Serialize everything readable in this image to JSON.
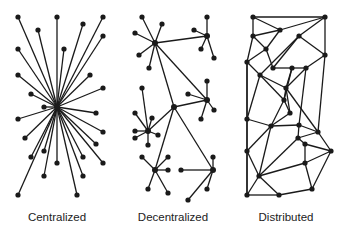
{
  "labels": {
    "centralized": "Centralized",
    "decentralized": "Decentralized",
    "distributed": "Distributed"
  },
  "style": {
    "line_color": "#1a1a1a",
    "node_color": "#1a1a1a",
    "node_radius": 2.6,
    "line_width": 1.3
  },
  "networks": {
    "centralized": {
      "hub": [
        57,
        107
      ],
      "nodes": [
        [
          18,
          17
        ],
        [
          57,
          17
        ],
        [
          103,
          17
        ],
        [
          83,
          24
        ],
        [
          38,
          30
        ],
        [
          103,
          36
        ],
        [
          18,
          49
        ],
        [
          64,
          49
        ],
        [
          18,
          75
        ],
        [
          90,
          75
        ],
        [
          31,
          94
        ],
        [
          103,
          88
        ],
        [
          44,
          107
        ],
        [
          96,
          113
        ],
        [
          18,
          119
        ],
        [
          103,
          132
        ],
        [
          25,
          138
        ],
        [
          96,
          144
        ],
        [
          44,
          151
        ],
        [
          31,
          157
        ],
        [
          83,
          157
        ],
        [
          57,
          163
        ],
        [
          103,
          163
        ],
        [
          44,
          176
        ],
        [
          83,
          176
        ],
        [
          18,
          195
        ],
        [
          77,
          195
        ]
      ]
    },
    "decentralized": {
      "hubs": {
        "A": [
          155,
          43
        ],
        "B": [
          207,
          36
        ],
        "C": [
          174,
          107
        ],
        "D": [
          207,
          100
        ],
        "E": [
          148,
          131
        ],
        "F": [
          155,
          170
        ],
        "G": [
          213,
          170
        ]
      },
      "hub_links": [
        [
          "A",
          "B"
        ],
        [
          "A",
          "C"
        ],
        [
          "A",
          "D"
        ],
        [
          "C",
          "D"
        ],
        [
          "C",
          "E"
        ],
        [
          "C",
          "F"
        ],
        [
          "C",
          "G"
        ]
      ],
      "leaves": {
        "A": [
          [
            142,
            17
          ],
          [
            162,
            24
          ],
          [
            135,
            33
          ],
          [
            139,
            55
          ],
          [
            149,
            68
          ]
        ],
        "B": [
          [
            207,
            17
          ],
          [
            194,
            30
          ],
          [
            201,
            49
          ],
          [
            214,
            58
          ]
        ],
        "D": [
          [
            207,
            81
          ],
          [
            188,
            94
          ],
          [
            214,
            110
          ],
          [
            201,
            119
          ]
        ],
        "E": [
          [
            142,
            88
          ],
          [
            152,
            118
          ],
          [
            135,
            113
          ],
          [
            135,
            131
          ],
          [
            135,
            138
          ],
          [
            158,
            135
          ],
          [
            148,
            145
          ]
        ],
        "F": [
          [
            142,
            157
          ],
          [
            168,
            157
          ],
          [
            168,
            170
          ],
          [
            148,
            189
          ],
          [
            168,
            193
          ]
        ],
        "G": [
          [
            213,
            157
          ],
          [
            181,
            170
          ],
          [
            207,
            189
          ],
          [
            188,
            200
          ]
        ]
      }
    },
    "distributed": {
      "nodes": [
        [
          253,
          17
        ],
        [
          325,
          17
        ],
        [
          280,
          30
        ],
        [
          253,
          36
        ],
        [
          299,
          36
        ],
        [
          266,
          49
        ],
        [
          247,
          62
        ],
        [
          325,
          55
        ],
        [
          273,
          68
        ],
        [
          292,
          68
        ],
        [
          306,
          68
        ],
        [
          260,
          75
        ],
        [
          286,
          88
        ],
        [
          284,
          100
        ],
        [
          290,
          113
        ],
        [
          247,
          119
        ],
        [
          271,
          126
        ],
        [
          299,
          125
        ],
        [
          318,
          132
        ],
        [
          298,
          138
        ],
        [
          305,
          144
        ],
        [
          331,
          151
        ],
        [
          247,
          151
        ],
        [
          305,
          163
        ],
        [
          259,
          176
        ],
        [
          312,
          189
        ],
        [
          247,
          195
        ],
        [
          279,
          195
        ]
      ],
      "edges": [
        [
          0,
          1
        ],
        [
          0,
          2
        ],
        [
          0,
          3
        ],
        [
          1,
          2
        ],
        [
          1,
          7
        ],
        [
          1,
          4
        ],
        [
          2,
          3
        ],
        [
          2,
          5
        ],
        [
          3,
          5
        ],
        [
          3,
          6
        ],
        [
          4,
          8
        ],
        [
          4,
          11
        ],
        [
          4,
          7
        ],
        [
          5,
          6
        ],
        [
          5,
          8
        ],
        [
          6,
          11
        ],
        [
          6,
          15
        ],
        [
          6,
          26
        ],
        [
          7,
          10
        ],
        [
          7,
          18
        ],
        [
          8,
          9
        ],
        [
          9,
          10
        ],
        [
          9,
          12
        ],
        [
          10,
          12
        ],
        [
          11,
          12
        ],
        [
          11,
          15
        ],
        [
          11,
          13
        ],
        [
          12,
          13
        ],
        [
          12,
          14
        ],
        [
          13,
          14
        ],
        [
          13,
          16
        ],
        [
          12,
          18
        ],
        [
          14,
          16
        ],
        [
          15,
          16
        ],
        [
          15,
          22
        ],
        [
          16,
          17
        ],
        [
          16,
          24
        ],
        [
          16,
          22
        ],
        [
          17,
          19
        ],
        [
          17,
          18
        ],
        [
          18,
          19
        ],
        [
          18,
          21
        ],
        [
          19,
          20
        ],
        [
          19,
          24
        ],
        [
          20,
          23
        ],
        [
          20,
          21
        ],
        [
          21,
          23
        ],
        [
          21,
          25
        ],
        [
          22,
          24
        ],
        [
          22,
          26
        ],
        [
          23,
          25
        ],
        [
          23,
          24
        ],
        [
          24,
          26
        ],
        [
          24,
          27
        ],
        [
          25,
          27
        ],
        [
          26,
          27
        ],
        [
          13,
          9
        ],
        [
          10,
          17
        ]
      ]
    }
  }
}
